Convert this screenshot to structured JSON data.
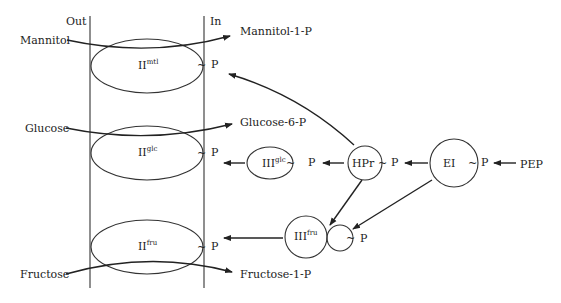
{
  "diagram": {
    "membrane": {
      "out_label": "Out",
      "in_label": "In"
    },
    "transporters": [
      {
        "name": "II",
        "sup": "mtl",
        "substrate": "Mannitol",
        "product": "Mannitol-1-P",
        "phospho": "P"
      },
      {
        "name": "II",
        "sup": "glc",
        "substrate": "Glucose",
        "product": "Glucose-6-P",
        "phospho": "P"
      },
      {
        "name": "II",
        "sup": "fru",
        "substrate": "Fructose",
        "product": "Fructose-1-P",
        "phospho": "P"
      }
    ],
    "cytoplasmic": {
      "iii_glc": {
        "name": "III",
        "sup": "glc",
        "phospho": "P"
      },
      "iii_fru": {
        "name": "III",
        "sup": "fru",
        "phospho": "P"
      },
      "hpr": {
        "name": "HPr",
        "phospho": "P"
      },
      "ei": {
        "name": "EI",
        "phospho": "P"
      },
      "pep": "PEP"
    },
    "tilde": "~",
    "colors": {
      "line": "#333333",
      "text": "#222222",
      "background": "#ffffff"
    }
  }
}
